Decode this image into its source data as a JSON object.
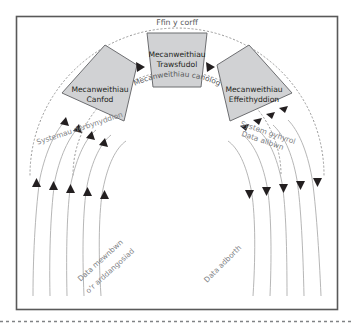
{
  "figure": {
    "title_label": "Ffin y corff",
    "frame": {
      "border_color": "#595959",
      "background": "#ffffff"
    },
    "bottom_rule": {
      "name": "dashed-separator",
      "color": "#808285",
      "style": "dashed"
    }
  },
  "boundaries": {
    "outer_arc": {
      "label": "Ffin y corff",
      "style": "dotted",
      "color": "#9a9a9a"
    },
    "inner_arc": {
      "label": "Mecanweithiau canolog",
      "style": "dotted",
      "color": "#9a9a9a"
    }
  },
  "blocks": [
    {
      "id": "canfod",
      "line1": "Mecanweithiau",
      "line2": "Canfod",
      "fill": "#d1d2d4",
      "stroke": "#6d6e71"
    },
    {
      "id": "trawsfudol",
      "line1": "Mecanweithiau",
      "line2": "Trawsfudol",
      "fill": "#d1d2d4",
      "stroke": "#6d6e71"
    },
    {
      "id": "effeithyddion",
      "line1": "Mecanweithiau",
      "line2": "Effeithyddion",
      "fill": "#d1d2d4",
      "stroke": "#6d6e71"
    }
  ],
  "side_labels": {
    "left_system": "Systemau derbynyddion",
    "right_system": "System gyhyrol",
    "right_output": "Data allbwn"
  },
  "flow_labels": {
    "input_line1": "Data mewnbwn",
    "input_line2": "o'r arddangosiad",
    "feedback": "Data adborth"
  },
  "arrows": {
    "input_arrowheads": 5,
    "input_direction": "up",
    "output_arrowheads": 5,
    "output_direction": "down",
    "between_blocks": 2,
    "between_direction": "right",
    "color": "#231f20"
  }
}
